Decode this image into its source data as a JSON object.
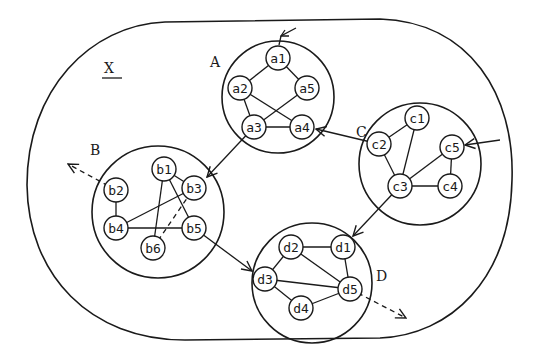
{
  "diagram": {
    "title": "X",
    "title_underlined": true,
    "stroke_color": "#1a1a1a",
    "background": "#ffffff",
    "clusters": [
      {
        "id": "A",
        "label": "A",
        "cx": 278,
        "cy": 97,
        "r": 56,
        "label_x": 210,
        "label_y": 67
      },
      {
        "id": "B",
        "label": "B",
        "cx": 158,
        "cy": 212,
        "r": 66,
        "label_x": 90,
        "label_y": 155
      },
      {
        "id": "C",
        "label": "C",
        "cx": 420,
        "cy": 164,
        "r": 61,
        "label_x": 356,
        "label_y": 137
      },
      {
        "id": "D",
        "label": "D",
        "cx": 312,
        "cy": 283,
        "r": 60,
        "label_x": 376,
        "label_y": 281
      }
    ],
    "nodes": [
      {
        "id": "a1",
        "label": "a1",
        "x": 278,
        "y": 58
      },
      {
        "id": "a2",
        "label": "a2",
        "x": 240,
        "y": 88
      },
      {
        "id": "a5",
        "label": "a5",
        "x": 307,
        "y": 88
      },
      {
        "id": "a3",
        "label": "a3",
        "x": 254,
        "y": 127
      },
      {
        "id": "a4",
        "label": "a4",
        "x": 302,
        "y": 127
      },
      {
        "id": "b1",
        "label": "b1",
        "x": 164,
        "y": 169
      },
      {
        "id": "b2",
        "label": "b2",
        "x": 116,
        "y": 190
      },
      {
        "id": "b3",
        "label": "b3",
        "x": 194,
        "y": 188
      },
      {
        "id": "b4",
        "label": "b4",
        "x": 116,
        "y": 228
      },
      {
        "id": "b5",
        "label": "b5",
        "x": 194,
        "y": 228
      },
      {
        "id": "b6",
        "label": "b6",
        "x": 153,
        "y": 248
      },
      {
        "id": "c1",
        "label": "c1",
        "x": 417,
        "y": 118
      },
      {
        "id": "c2",
        "label": "c2",
        "x": 379,
        "y": 144
      },
      {
        "id": "c5",
        "label": "c5",
        "x": 452,
        "y": 147
      },
      {
        "id": "c3",
        "label": "c3",
        "x": 400,
        "y": 186
      },
      {
        "id": "c4",
        "label": "c4",
        "x": 450,
        "y": 186
      },
      {
        "id": "d2",
        "label": "d2",
        "x": 291,
        "y": 247
      },
      {
        "id": "d1",
        "label": "d1",
        "x": 343,
        "y": 247
      },
      {
        "id": "d3",
        "label": "d3",
        "x": 265,
        "y": 279
      },
      {
        "id": "d5",
        "label": "d5",
        "x": 350,
        "y": 289
      },
      {
        "id": "d4",
        "label": "d4",
        "x": 301,
        "y": 308
      }
    ],
    "edges": [
      {
        "from": "a1",
        "to": "a2"
      },
      {
        "from": "a1",
        "to": "a5"
      },
      {
        "from": "a2",
        "to": "a3"
      },
      {
        "from": "a2",
        "to": "a4"
      },
      {
        "from": "a5",
        "to": "a3"
      },
      {
        "from": "a3",
        "to": "a4"
      },
      {
        "from": "b1",
        "to": "b3"
      },
      {
        "from": "b1",
        "to": "b6"
      },
      {
        "from": "b1",
        "to": "b5"
      },
      {
        "from": "b2",
        "to": "b4"
      },
      {
        "from": "b4",
        "to": "b3"
      },
      {
        "from": "b4",
        "to": "b5"
      },
      {
        "from": "b6",
        "to": "b3",
        "style": "dashed"
      },
      {
        "from": "c1",
        "to": "c2"
      },
      {
        "from": "c1",
        "to": "c3"
      },
      {
        "from": "c2",
        "to": "c3"
      },
      {
        "from": "c3",
        "to": "c5"
      },
      {
        "from": "c3",
        "to": "c4"
      },
      {
        "from": "c5",
        "to": "c4"
      },
      {
        "from": "d2",
        "to": "d1"
      },
      {
        "from": "d2",
        "to": "d3"
      },
      {
        "from": "d2",
        "to": "d5"
      },
      {
        "from": "d1",
        "to": "d5"
      },
      {
        "from": "d3",
        "to": "d5"
      },
      {
        "from": "d3",
        "to": "d4"
      },
      {
        "from": "d4",
        "to": "d5"
      }
    ],
    "arrows": [
      {
        "id": "a3-to-b3",
        "from": "a3",
        "to": "b3",
        "type": "inter-cluster"
      },
      {
        "id": "c2-to-a4",
        "from": "c2",
        "to": "a4",
        "type": "inter-cluster"
      },
      {
        "id": "c3-to-d1",
        "from": "c3",
        "to": "d1",
        "type": "inter-cluster"
      },
      {
        "id": "b5-to-d3",
        "from": "b5",
        "to": "d3",
        "type": "inter-cluster"
      },
      {
        "id": "external-to-a1",
        "from": "outside",
        "to": "a1",
        "type": "incoming"
      },
      {
        "id": "external-to-c5",
        "from": "outside",
        "to": "c5",
        "type": "incoming"
      },
      {
        "id": "b2-to-external",
        "from": "b2",
        "to": "outside",
        "type": "outgoing",
        "style": "dashed"
      },
      {
        "id": "d5-to-external",
        "from": "d5",
        "to": "outside",
        "type": "outgoing",
        "style": "dashed"
      }
    ]
  }
}
